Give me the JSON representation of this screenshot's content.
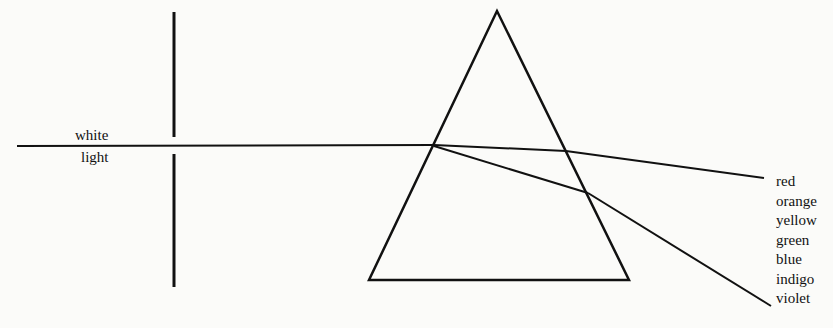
{
  "diagram": {
    "beam_label": {
      "line1": "white",
      "line2": "light"
    },
    "spectrum_colors": [
      "red",
      "orange",
      "yellow",
      "green",
      "blue",
      "indigo",
      "violet"
    ],
    "line_color": "#111111"
  }
}
